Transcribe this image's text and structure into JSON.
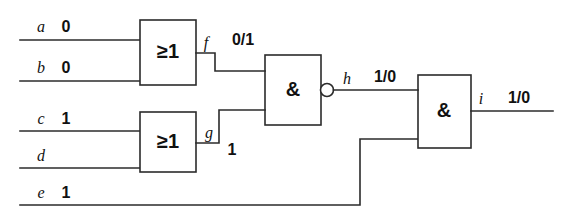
{
  "diagram": {
    "gates": [
      {
        "id": "or1",
        "symbol": "≥1",
        "type": "or-gate",
        "x": 140,
        "y": 20,
        "w": 56,
        "h": 65
      },
      {
        "id": "or2",
        "symbol": "≥1",
        "type": "or-gate",
        "x": 140,
        "y": 112,
        "w": 56,
        "h": 60
      },
      {
        "id": "nand1",
        "symbol": "&",
        "type": "nand-gate",
        "x": 265,
        "y": 55,
        "w": 56,
        "h": 70
      },
      {
        "id": "and1",
        "symbol": "&",
        "type": "and-gate",
        "x": 418,
        "y": 75,
        "w": 53,
        "h": 73
      }
    ],
    "inputs": [
      {
        "id": "a",
        "name": "a",
        "value": "0",
        "y": 32
      },
      {
        "id": "b",
        "name": "b",
        "value": "0",
        "y": 73
      },
      {
        "id": "c",
        "name": "c",
        "value": "1",
        "y": 124
      },
      {
        "id": "d",
        "name": "d",
        "value": "",
        "y": 161
      },
      {
        "id": "e",
        "name": "e",
        "value": "1",
        "y": 198
      }
    ],
    "signals": [
      {
        "id": "f",
        "name": "f",
        "value": "0/1"
      },
      {
        "id": "g",
        "name": "g",
        "value": "1"
      },
      {
        "id": "h",
        "name": "h",
        "value": "1/0"
      },
      {
        "id": "i",
        "name": "i",
        "value": "1/0"
      }
    ],
    "colors": {
      "line": "#2b2b2b",
      "text": "#111111",
      "background": "#ffffff"
    }
  }
}
